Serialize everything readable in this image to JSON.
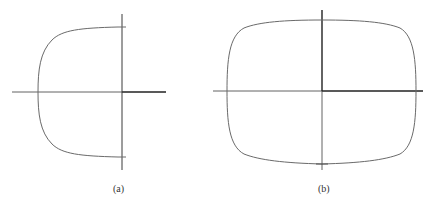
{
  "figure": {
    "panels": [
      {
        "id": "a",
        "caption": "(a)",
        "description": "Half closed curve on left side of vertical axis, meeting vertical axis at top and bottom"
      },
      {
        "id": "b",
        "caption": "(b)",
        "description": "Closed rounded-rectangle (superellipse-like) curve centered on axes"
      }
    ],
    "colors": {
      "axis": "#3a3a3a",
      "curve": "#6a6a6a",
      "background": "#ffffff"
    }
  }
}
